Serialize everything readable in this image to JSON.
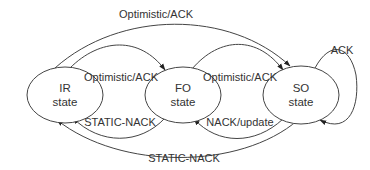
{
  "diagram": {
    "type": "state-transition",
    "nodes": [
      {
        "id": "ir",
        "line1": "IR",
        "line2": "state"
      },
      {
        "id": "fo",
        "line1": "FO",
        "line2": "state"
      },
      {
        "id": "so",
        "line1": "SO",
        "line2": "state"
      }
    ],
    "edges": [
      {
        "from": "ir",
        "to": "so",
        "label": "Optimistic/ACK",
        "position": "top-outer"
      },
      {
        "from": "ir",
        "to": "fo",
        "label": "Optimistic/ACK",
        "position": "top-inner"
      },
      {
        "from": "fo",
        "to": "so",
        "label": "Optimistic/ACK",
        "position": "top-inner"
      },
      {
        "from": "so",
        "to": "so",
        "label": "ACK",
        "position": "self-loop-right"
      },
      {
        "from": "fo",
        "to": "ir",
        "label": "STATIC-NACK",
        "position": "bottom-inner"
      },
      {
        "from": "so",
        "to": "fo",
        "label": "NACK/update",
        "position": "bottom-inner"
      },
      {
        "from": "so",
        "to": "ir",
        "label": "STATIC-NACK",
        "position": "bottom-outer"
      }
    ]
  }
}
